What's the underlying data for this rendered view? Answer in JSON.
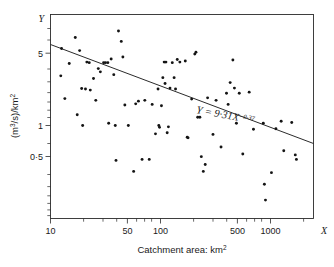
{
  "chart_data": {
    "type": "scatter",
    "title": "",
    "xlabel": "Catchment area: km2",
    "ylabel": "(m3/s)/km2",
    "x_axis_name": "X",
    "y_axis_name": "Y",
    "xscale": "log",
    "yscale": "log",
    "xlim": [
      10,
      2000
    ],
    "ylim": [
      0.17,
      9.5
    ],
    "grid": false,
    "legend": null,
    "xtick_labels": [
      "10",
      "50",
      "100",
      "500",
      "1000"
    ],
    "xtick_values": [
      10,
      50,
      100,
      500,
      1000
    ],
    "ytick_labels": [
      "5",
      "1",
      "0.5"
    ],
    "ytick_values": [
      5,
      1,
      0.5
    ],
    "annotation": {
      "base": "Y = 9·31X",
      "exponent": "−0·37",
      "full": "Y = 9·31X^−0·37"
    },
    "fit": {
      "form": "power-law",
      "coefficient": 9.31,
      "exponent": -0.37,
      "x_start": 10,
      "x_end": 2000,
      "y_start": 3.97,
      "y_end": 0.67
    },
    "series": [
      {
        "name": "catchments",
        "marker": "dot",
        "color": "#141414",
        "points": [
          [
            12.4,
            3.02
          ],
          [
            12.6,
            5.55
          ],
          [
            13.5,
            1.82
          ],
          [
            14.8,
            3.97
          ],
          [
            16.8,
            7.1
          ],
          [
            17.5,
            1.27
          ],
          [
            18.4,
            5.3
          ],
          [
            19.2,
            2.28
          ],
          [
            19.6,
            1.0
          ],
          [
            20.8,
            2.25
          ],
          [
            21.4,
            4.1
          ],
          [
            22.5,
            4.05
          ],
          [
            23.0,
            2.2
          ],
          [
            24.6,
            2.85
          ],
          [
            25.8,
            1.75
          ],
          [
            27.2,
            3.55
          ],
          [
            28.4,
            3.3
          ],
          [
            30.4,
            4.05
          ],
          [
            31.6,
            4.05
          ],
          [
            33.2,
            4.05
          ],
          [
            33.8,
            1.05
          ],
          [
            35.6,
            4.4
          ],
          [
            37.6,
            3.1
          ],
          [
            38.8,
            1.0
          ],
          [
            39.4,
            0.46
          ],
          [
            41.5,
            8.2
          ],
          [
            44.0,
            6.5
          ],
          [
            45.5,
            4.6
          ],
          [
            47.4,
            1.58
          ],
          [
            51.0,
            1.0
          ],
          [
            57.0,
            0.36
          ],
          [
            59.5,
            1.62
          ],
          [
            63.0,
            1.72
          ],
          [
            68.0,
            0.47
          ],
          [
            72.0,
            1.75
          ],
          [
            79.0,
            0.47
          ],
          [
            84.0,
            1.6
          ],
          [
            90.0,
            0.83
          ],
          [
            95.0,
            2.25
          ],
          [
            96.5,
            1.0
          ],
          [
            98.0,
            0.96
          ],
          [
            102.0,
            1.55
          ],
          [
            105.0,
            2.9
          ],
          [
            108.0,
            4.1
          ],
          [
            110.0,
            2.55
          ],
          [
            112.0,
            4.1
          ],
          [
            115.0,
            0.85
          ],
          [
            118.0,
            0.97
          ],
          [
            122.0,
            2.3
          ],
          [
            128.0,
            4.05
          ],
          [
            133.0,
            2.9
          ],
          [
            137.0,
            2.25
          ],
          [
            142.0,
            4.35
          ],
          [
            150.0,
            4.1
          ],
          [
            168.0,
            4.2
          ],
          [
            175.0,
            0.77
          ],
          [
            178.0,
            0.76
          ],
          [
            192.0,
            1.8
          ],
          [
            205.0,
            4.9
          ],
          [
            210.0,
            5.1
          ],
          [
            218.0,
            1.2
          ],
          [
            228.0,
            1.2
          ],
          [
            235.0,
            0.5
          ],
          [
            245.0,
            0.36
          ],
          [
            255.0,
            0.42
          ],
          [
            268.0,
            1.85
          ],
          [
            300.0,
            0.82
          ],
          [
            320.0,
            1.75
          ],
          [
            355.0,
            0.62
          ],
          [
            398.0,
            2.05
          ],
          [
            412.0,
            1.6
          ],
          [
            430.0,
            2.6
          ],
          [
            455.0,
            4.3
          ],
          [
            470.0,
            2.3
          ],
          [
            490.0,
            1.05
          ],
          [
            520.0,
            2.05
          ],
          [
            560.0,
            0.53
          ],
          [
            640.0,
            2.1
          ],
          [
            700.0,
            0.92
          ],
          [
            860.0,
            1.05
          ],
          [
            880.0,
            0.27
          ],
          [
            900.0,
            0.19
          ],
          [
            1020.0,
            0.35
          ],
          [
            1120.0,
            0.93
          ],
          [
            1250.0,
            1.1
          ],
          [
            1320.0,
            0.57
          ],
          [
            1560.0,
            1.07
          ],
          [
            1680.0,
            0.52
          ],
          [
            1720.0,
            0.47
          ]
        ]
      }
    ]
  },
  "figure": {
    "background": "#ffffff",
    "ink": "#2b2b2b",
    "marker_color": "#141414"
  }
}
